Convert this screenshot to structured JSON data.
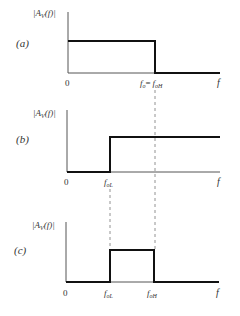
{
  "figure": {
    "panels": [
      {
        "id": "a",
        "tag": "(a)",
        "ylabel": "|A_V(f)|",
        "origin": "0",
        "xlabel": "f",
        "cutoff_label": "f_o = f_oH",
        "type": "ideal-lowpass"
      },
      {
        "id": "b",
        "tag": "(b)",
        "ylabel": "|A_V(f)|",
        "origin": "0",
        "xlabel": "f",
        "cutoff_label": "f_oL",
        "type": "ideal-highpass"
      },
      {
        "id": "c",
        "tag": "(c)",
        "ylabel": "|A_V(f)|",
        "origin": "0",
        "xlabel": "f",
        "cutoff_low_label": "f_oL",
        "cutoff_high_label": "f_oH",
        "type": "ideal-bandpass"
      }
    ],
    "text": {
      "tag_a": "(a)",
      "tag_b": "(b)",
      "tag_c": "(c)",
      "ylabel_main": "|A",
      "ylabel_sub": "V",
      "ylabel_tail": "(f)|",
      "zero": "0",
      "f": "f",
      "fo": "f",
      "fo_sub": "o",
      "eq": "=",
      "foH_sub": "oH",
      "foL_sub": "oL"
    },
    "colors": {
      "curve": "#111111",
      "axis": "#555555",
      "dashed": "#777777"
    }
  }
}
